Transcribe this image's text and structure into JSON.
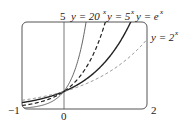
{
  "chart_data": {
    "type": "line",
    "title": "",
    "xlabel": "",
    "ylabel": "",
    "xlim": [
      -1,
      2
    ],
    "ylim": [
      0,
      5
    ],
    "grid": false,
    "x_tick_labels": [
      "-1",
      "0",
      "2"
    ],
    "y_tick_labels": [
      "5"
    ],
    "series": [
      {
        "name": "y = 20^x",
        "base": 20,
        "style": "solid-thin",
        "color": "#555555",
        "x": [
          -1,
          -0.5,
          0,
          0.25,
          0.5,
          0.537
        ],
        "values": [
          0.05,
          0.224,
          1,
          2.115,
          4.472,
          5
        ]
      },
      {
        "name": "y = 5^x",
        "base": 5,
        "style": "dashed",
        "color": "#222222",
        "x": [
          -1,
          -0.5,
          0,
          0.5,
          0.8,
          1.0
        ],
        "values": [
          0.2,
          0.447,
          1,
          2.236,
          3.624,
          5
        ]
      },
      {
        "name": "y = e^x",
        "base": 2.71828,
        "style": "solid-thick",
        "color": "#222222",
        "x": [
          -1,
          -0.5,
          0,
          0.5,
          1,
          1.5,
          1.609
        ],
        "values": [
          0.368,
          0.607,
          1,
          1.649,
          2.718,
          4.482,
          5
        ]
      },
      {
        "name": "y = 2^x",
        "base": 2,
        "style": "dashed-light",
        "color": "#888888",
        "x": [
          -1,
          -0.5,
          0,
          0.5,
          1,
          1.5,
          2
        ],
        "values": [
          0.5,
          0.707,
          1,
          1.414,
          2,
          2.828,
          4
        ]
      }
    ],
    "annotations": [
      "y = 20^x",
      "y = 5^x",
      "y = e^x",
      "y = 2^x"
    ]
  },
  "labels": {
    "ytop": "5",
    "xmin": "−1",
    "xzero": "0",
    "xmax": "2",
    "eq20_pre": "y = 20",
    "eq20_exp": "x",
    "eq5_pre": "y = 5",
    "eq5_exp": "x",
    "eqe_pre": "y = e",
    "eqe_exp": "x",
    "eq2_pre": "y = 2",
    "eq2_exp": "x"
  }
}
